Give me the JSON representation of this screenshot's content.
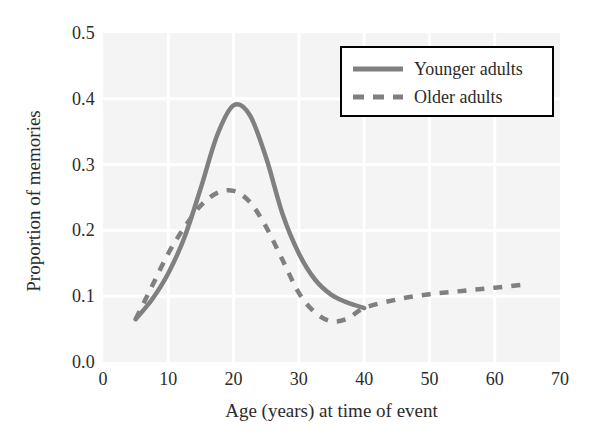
{
  "chart_data": {
    "type": "line",
    "title": "",
    "xlabel": "Age (years) at time of event",
    "ylabel": "Proportion of memories",
    "xlim": [
      0,
      70
    ],
    "ylim": [
      0.0,
      0.5
    ],
    "xticks": [
      "0",
      "10",
      "20",
      "30",
      "40",
      "50",
      "60",
      "70"
    ],
    "xtick_values": [
      0,
      10,
      20,
      30,
      40,
      50,
      60,
      70
    ],
    "yticks": [
      "0.0",
      "0.1",
      "0.2",
      "0.3",
      "0.4",
      "0.5"
    ],
    "ytick_values": [
      0.0,
      0.1,
      0.2,
      0.3,
      0.4,
      0.5
    ],
    "grid": true,
    "grid_color": "#ffffff",
    "plot_bgcolor": "#f4f4f4",
    "legend_position": "top-right",
    "series": [
      {
        "name": "Younger adults",
        "style": "solid",
        "color": "#808080",
        "x": [
          5,
          7.5,
          10,
          12.5,
          15,
          17.5,
          20,
          22.5,
          25,
          27.5,
          30,
          32.5,
          35,
          37.5,
          40
        ],
        "values": [
          0.065,
          0.095,
          0.135,
          0.19,
          0.265,
          0.345,
          0.39,
          0.375,
          0.31,
          0.225,
          0.165,
          0.125,
          0.102,
          0.09,
          0.082
        ]
      },
      {
        "name": "Older adults",
        "style": "dashed",
        "color": "#808080",
        "x": [
          5,
          7.5,
          10,
          12.5,
          15,
          17.5,
          20,
          22.5,
          25,
          27.5,
          30,
          32.5,
          35,
          37.5,
          40,
          45,
          50,
          55,
          60,
          65
        ],
        "values": [
          0.065,
          0.115,
          0.165,
          0.205,
          0.238,
          0.257,
          0.26,
          0.243,
          0.205,
          0.155,
          0.105,
          0.075,
          0.062,
          0.066,
          0.082,
          0.095,
          0.103,
          0.108,
          0.113,
          0.118
        ]
      }
    ]
  },
  "legend": {
    "entries": [
      {
        "label": "Younger adults",
        "icon": "solid-line-swatch"
      },
      {
        "label": "Older adults",
        "icon": "dashed-line-swatch"
      }
    ]
  }
}
